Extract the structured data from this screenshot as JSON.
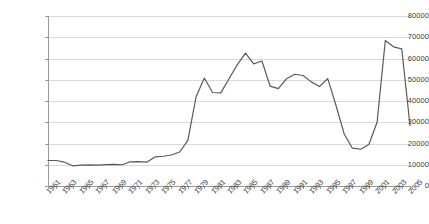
{
  "chart_data": {
    "type": "line",
    "title": "",
    "xlabel": "",
    "ylabel": "",
    "xlim": [
      1961,
      2005
    ],
    "ylim": [
      0,
      80000
    ],
    "ytick_step": 10000,
    "xtick_step": 1,
    "xlabel_step": 2,
    "grid": true,
    "legend": "none",
    "line_color": "#595959",
    "gridline_color": "#d9d9d9",
    "axis_color": "#9a9a9a",
    "yticks": [
      "0",
      "10000",
      "20000",
      "30000",
      "40000",
      "50000",
      "60000",
      "70000",
      "80000"
    ],
    "ytick_values": [
      0,
      10000,
      20000,
      30000,
      40000,
      50000,
      60000,
      70000,
      80000
    ],
    "xticks": [
      "1961",
      "1963",
      "1965",
      "1967",
      "1969",
      "1971",
      "1973",
      "1975",
      "1977",
      "1979",
      "1981",
      "1983",
      "1985",
      "1987",
      "1989",
      "1991",
      "1993",
      "1995",
      "1997",
      "1999",
      "2001",
      "2003",
      "2005"
    ],
    "x": [
      1961,
      1962,
      1963,
      1964,
      1965,
      1966,
      1967,
      1968,
      1969,
      1970,
      1971,
      1972,
      1973,
      1974,
      1975,
      1976,
      1977,
      1978,
      1979,
      1980,
      1981,
      1982,
      1983,
      1984,
      1985,
      1986,
      1987,
      1988,
      1989,
      1990,
      1991,
      1992,
      1993,
      1994,
      1995,
      1996,
      1997,
      1998,
      1999,
      2000,
      2001,
      2002,
      2003,
      2004,
      2005
    ],
    "series": [
      {
        "name": "series-1",
        "values": [
          12000,
          12000,
          11200,
          9500,
          9800,
          9900,
          9800,
          10100,
          10200,
          10000,
          11400,
          11500,
          11200,
          13700,
          14000,
          14600,
          16000,
          21500,
          42000,
          50800,
          44000,
          43800,
          50500,
          57000,
          62500,
          57500,
          58800,
          47000,
          45800,
          50500,
          52600,
          52000,
          49000,
          46800,
          50500,
          38000,
          24500,
          17800,
          17300,
          19500,
          30000,
          68500,
          65500,
          64500,
          28500
        ]
      }
    ]
  }
}
